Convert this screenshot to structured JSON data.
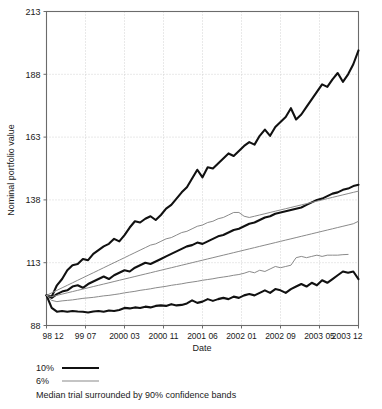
{
  "chart_data": {
    "type": "line",
    "title": "",
    "xlabel": "Date",
    "ylabel": "Nominal portfolio value",
    "caption": "Median trial surrounded by 90% confidence bands",
    "grid": true,
    "legend_position": "below-left",
    "ylim": [
      88,
      213
    ],
    "yticks": [
      88,
      113,
      138,
      163,
      188,
      213
    ],
    "ytick_labels": [
      "88",
      "113",
      "138",
      "163",
      "188",
      "213"
    ],
    "xtick_labels": [
      "98 12",
      "99 07",
      "2000 03",
      "2000 11",
      "2001 06",
      "2002 01",
      "2002 09",
      "2003 05",
      "2003 12"
    ],
    "xlim_index": [
      0,
      60
    ],
    "x_index": [
      0,
      1,
      2,
      3,
      4,
      5,
      6,
      7,
      8,
      9,
      10,
      11,
      12,
      13,
      14,
      15,
      16,
      17,
      18,
      19,
      20,
      21,
      22,
      23,
      24,
      25,
      26,
      27,
      28,
      29,
      30,
      31,
      32,
      33,
      34,
      35,
      36,
      37,
      38,
      39,
      40,
      41,
      42,
      43,
      44,
      45,
      46,
      47,
      48,
      49,
      50,
      51,
      52,
      53,
      54,
      55,
      56,
      57,
      58,
      59,
      60
    ],
    "legend": [
      {
        "label": "10%",
        "color": "#111111",
        "width": 2.1
      },
      {
        "label": "6%",
        "color": "#8a8a8a",
        "width": 1.0
      }
    ],
    "series": [
      {
        "name": "10% upper confidence band",
        "group": "10%",
        "role": "upper",
        "color": "#111111",
        "width": 2.1,
        "values": [
          100.0,
          99.5,
          104.0,
          106.5,
          110.0,
          112.0,
          112.5,
          114.5,
          114.0,
          116.5,
          118.0,
          119.5,
          120.5,
          122.5,
          121.5,
          124.0,
          127.0,
          129.5,
          129.0,
          130.5,
          131.5,
          130.0,
          132.0,
          134.5,
          136.0,
          138.5,
          141.0,
          143.0,
          146.5,
          150.0,
          147.0,
          151.0,
          150.5,
          152.5,
          154.5,
          156.5,
          155.5,
          157.5,
          159.5,
          161.0,
          160.0,
          163.5,
          166.0,
          163.5,
          167.0,
          169.0,
          171.0,
          174.5,
          170.0,
          172.0,
          175.0,
          178.0,
          181.0,
          184.0,
          183.0,
          186.0,
          188.5,
          185.0,
          188.0,
          192.0,
          197.5
        ]
      },
      {
        "name": "10% median trial",
        "group": "10%",
        "role": "median",
        "color": "#111111",
        "width": 2.1,
        "values": [
          100.0,
          99.0,
          100.5,
          101.5,
          102.0,
          103.5,
          104.0,
          103.0,
          104.5,
          105.5,
          106.5,
          107.5,
          106.5,
          108.0,
          109.0,
          110.0,
          109.5,
          111.0,
          112.0,
          113.0,
          112.5,
          113.5,
          114.5,
          115.5,
          116.5,
          117.5,
          118.5,
          119.5,
          120.0,
          121.0,
          120.5,
          121.5,
          122.5,
          123.5,
          124.0,
          125.0,
          126.0,
          126.5,
          127.5,
          128.5,
          129.0,
          130.0,
          131.0,
          131.5,
          132.5,
          133.0,
          133.5,
          134.0,
          134.5,
          135.0,
          136.0,
          137.0,
          138.0,
          138.5,
          139.5,
          140.5,
          141.0,
          142.0,
          142.5,
          143.5,
          144.0
        ]
      },
      {
        "name": "10% lower confidence band",
        "group": "10%",
        "role": "lower",
        "color": "#111111",
        "width": 2.1,
        "values": [
          100.0,
          95.0,
          93.5,
          93.8,
          93.5,
          93.8,
          93.6,
          93.5,
          93.2,
          93.6,
          93.8,
          93.5,
          94.0,
          93.8,
          94.2,
          95.0,
          94.8,
          95.2,
          95.0,
          95.5,
          95.2,
          95.8,
          96.0,
          95.8,
          96.5,
          96.0,
          96.2,
          96.8,
          98.0,
          97.0,
          97.5,
          98.5,
          97.8,
          98.5,
          99.0,
          98.5,
          99.5,
          99.0,
          100.0,
          100.5,
          100.0,
          101.0,
          102.0,
          101.0,
          102.5,
          102.0,
          101.0,
          102.5,
          103.5,
          104.5,
          103.5,
          105.0,
          104.0,
          106.0,
          105.0,
          106.5,
          108.0,
          109.5,
          109.0,
          109.5,
          106.5
        ]
      },
      {
        "name": "6% upper confidence band",
        "group": "6%",
        "role": "upper",
        "color": "#8a8a8a",
        "width": 1.0,
        "values": [
          100.0,
          101.0,
          102.0,
          103.0,
          104.0,
          105.0,
          106.0,
          107.0,
          108.0,
          109.0,
          110.0,
          111.0,
          112.0,
          113.0,
          114.0,
          115.0,
          116.0,
          117.0,
          118.0,
          119.0,
          120.0,
          120.5,
          121.5,
          122.5,
          123.0,
          124.0,
          125.0,
          125.5,
          126.5,
          127.5,
          128.0,
          129.0,
          129.5,
          130.5,
          131.0,
          132.0,
          133.0,
          133.0,
          131.5,
          131.0,
          131.5,
          132.0,
          132.5,
          133.0,
          133.5,
          134.0,
          134.5,
          135.0,
          135.5,
          136.0,
          136.5,
          137.0,
          137.5,
          138.0,
          138.5,
          139.0,
          139.5,
          140.0,
          140.5,
          141.0,
          141.5
        ]
      },
      {
        "name": "6% median trial",
        "group": "6%",
        "role": "median",
        "color": "#8a8a8a",
        "width": 1.0,
        "values": [
          100.0,
          99.5,
          100.0,
          100.5,
          101.0,
          101.5,
          102.0,
          102.5,
          103.0,
          103.5,
          104.0,
          104.5,
          105.0,
          105.5,
          106.0,
          106.5,
          107.0,
          107.5,
          108.0,
          108.5,
          109.0,
          109.5,
          110.0,
          110.5,
          111.0,
          111.5,
          112.0,
          112.5,
          113.0,
          113.5,
          114.0,
          114.5,
          115.0,
          115.5,
          116.0,
          116.5,
          117.0,
          117.5,
          118.0,
          118.5,
          119.0,
          119.5,
          120.0,
          120.5,
          121.0,
          121.5,
          122.0,
          122.5,
          123.0,
          123.5,
          124.0,
          124.5,
          125.0,
          125.5,
          126.0,
          126.5,
          127.0,
          127.5,
          128.0,
          128.5,
          129.5
        ]
      },
      {
        "name": "6% lower confidence band",
        "group": "6%",
        "role": "lower",
        "color": "#8a8a8a",
        "width": 1.0,
        "values": [
          100.0,
          98.0,
          97.5,
          97.8,
          98.0,
          98.2,
          98.5,
          98.8,
          99.0,
          99.2,
          99.5,
          99.8,
          100.0,
          100.3,
          100.6,
          101.0,
          101.3,
          101.6,
          102.0,
          102.3,
          102.6,
          103.0,
          103.3,
          103.6,
          104.0,
          104.3,
          104.6,
          105.0,
          105.3,
          105.6,
          106.0,
          106.3,
          106.6,
          107.0,
          107.3,
          107.6,
          108.0,
          108.3,
          108.8,
          109.5,
          109.0,
          110.0,
          109.5,
          110.5,
          111.5,
          111.0,
          111.5,
          112.0,
          115.0,
          115.5,
          115.0,
          115.5,
          116.0,
          115.5,
          116.0,
          116.0,
          116.0,
          116.2,
          116.3,
          null,
          null
        ]
      }
    ]
  },
  "axis": {
    "y_title": "Nominal portfolio value",
    "x_title": "Date"
  },
  "legend": {
    "row1_label": "10%",
    "row2_label": "6%",
    "caption": "Median trial surrounded by 90% confidence bands"
  },
  "colors": {
    "thick_line": "#111111",
    "thin_line": "#8a8a8a",
    "frame": "#6b6b6b",
    "grid": "#c8c8c8",
    "text": "#1a1a1a",
    "background": "#ffffff"
  }
}
